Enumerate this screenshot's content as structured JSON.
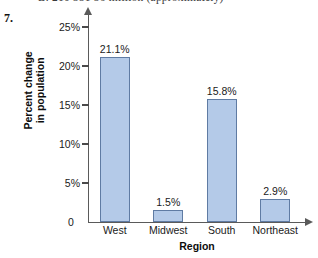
{
  "page": {
    "problem_number": "7.",
    "cropped_header_text": "B. 210       351        56 million (approximately)"
  },
  "chart_data": {
    "type": "bar",
    "title": "",
    "categories": [
      "West",
      "Midwest",
      "South",
      "Northeast"
    ],
    "values": [
      21.1,
      1.5,
      15.8,
      2.9
    ],
    "value_labels": [
      "21.1%",
      "1.5%",
      "15.8%",
      "2.9%"
    ],
    "xlabel": "Region",
    "ylabel_line1": "Percent change",
    "ylabel_line2": "in population",
    "ylim": [
      0,
      25
    ],
    "ytick_values": [
      0,
      5,
      10,
      15,
      20,
      25
    ],
    "ytick_labels": [
      "0",
      "5%",
      "10%",
      "15%",
      "20%",
      "25%"
    ],
    "grid": false,
    "legend": false,
    "bar_fill_color": "#b4cae8",
    "bar_border_color": "#5f7ba3",
    "axis_color": "#5a5a5a",
    "background_color": "#ffffff"
  }
}
